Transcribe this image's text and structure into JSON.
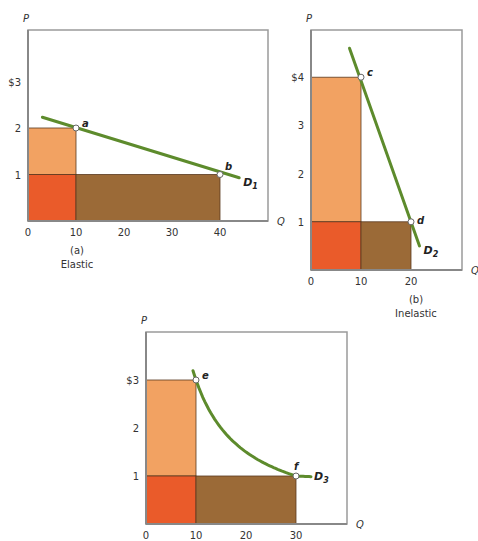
{
  "colors": {
    "upper_rect": "#f2a262",
    "overlap_rect": "#ea5b2a",
    "right_rect": "#9b6a37",
    "demand_line": "#5d8b2c",
    "frame": "#9a9a9a"
  },
  "chart_data": [
    {
      "id": "a",
      "type": "line",
      "panel_label": "(a)",
      "caption": "Elastic",
      "xlabel": "Q",
      "ylabel": "P",
      "xlim": [
        0,
        50
      ],
      "ylim": [
        0,
        4.1
      ],
      "x_ticks": [
        {
          "v": 0,
          "label": "0"
        },
        {
          "v": 10,
          "label": "10"
        },
        {
          "v": 20,
          "label": "20"
        },
        {
          "v": 30,
          "label": "30"
        },
        {
          "v": 40,
          "label": "40"
        }
      ],
      "y_ticks": [
        {
          "v": 1,
          "label": "1"
        },
        {
          "v": 2,
          "label": "2"
        },
        {
          "v": 3,
          "label": "$3"
        }
      ],
      "curve": {
        "name": "D",
        "subscript": "1",
        "shape": "linear",
        "points": [
          [
            3,
            2.23
          ],
          [
            44,
            0.93
          ]
        ]
      },
      "points": [
        {
          "label": "a",
          "q": 10,
          "p": 2
        },
        {
          "label": "b",
          "q": 40,
          "p": 1
        }
      ],
      "rectangles": [
        {
          "role": "upper",
          "q0": 0,
          "q1": 10,
          "p0": 1,
          "p1": 2
        },
        {
          "role": "overlap",
          "q0": 0,
          "q1": 10,
          "p0": 0,
          "p1": 1
        },
        {
          "role": "right",
          "q0": 10,
          "q1": 40,
          "p0": 0,
          "p1": 1
        }
      ]
    },
    {
      "id": "b",
      "type": "line",
      "panel_label": "(b)",
      "caption": "Inelastic",
      "xlabel": "Q",
      "ylabel": "P",
      "xlim": [
        0,
        30
      ],
      "ylim": [
        0,
        5
      ],
      "x_ticks": [
        {
          "v": 0,
          "label": "0"
        },
        {
          "v": 10,
          "label": "10"
        },
        {
          "v": 20,
          "label": "20"
        }
      ],
      "y_ticks": [
        {
          "v": 1,
          "label": "1"
        },
        {
          "v": 2,
          "label": "2"
        },
        {
          "v": 3,
          "label": "3"
        },
        {
          "v": 4,
          "label": "$4"
        }
      ],
      "curve": {
        "name": "D",
        "subscript": "2",
        "shape": "linear",
        "points": [
          [
            7.7,
            4.6
          ],
          [
            21.7,
            0.5
          ]
        ]
      },
      "points": [
        {
          "label": "c",
          "q": 10,
          "p": 4
        },
        {
          "label": "d",
          "q": 20,
          "p": 1
        }
      ],
      "rectangles": [
        {
          "role": "upper",
          "q0": 0,
          "q1": 10,
          "p0": 1,
          "p1": 4
        },
        {
          "role": "overlap",
          "q0": 0,
          "q1": 10,
          "p0": 0,
          "p1": 1
        },
        {
          "role": "right",
          "q0": 10,
          "q1": 20,
          "p0": 0,
          "p1": 1
        }
      ]
    },
    {
      "id": "c",
      "type": "line",
      "panel_label": "",
      "caption": "",
      "xlabel": "Q",
      "ylabel": "P",
      "xlim": [
        0,
        40
      ],
      "ylim": [
        0,
        4
      ],
      "x_ticks": [
        {
          "v": 0,
          "label": "0"
        },
        {
          "v": 10,
          "label": "10"
        },
        {
          "v": 20,
          "label": "20"
        },
        {
          "v": 30,
          "label": "30"
        }
      ],
      "y_ticks": [
        {
          "v": 1,
          "label": "1"
        },
        {
          "v": 2,
          "label": "2"
        },
        {
          "v": 3,
          "label": "$3"
        }
      ],
      "curve": {
        "name": "D",
        "subscript": "3",
        "shape": "unit-elastic",
        "q_range": [
          9.4,
          33
        ],
        "pq": 30
      },
      "points": [
        {
          "label": "e",
          "q": 10,
          "p": 3
        },
        {
          "label": "f",
          "q": 30,
          "p": 1
        }
      ],
      "rectangles": [
        {
          "role": "upper",
          "q0": 0,
          "q1": 10,
          "p0": 1,
          "p1": 3
        },
        {
          "role": "overlap",
          "q0": 0,
          "q1": 10,
          "p0": 0,
          "p1": 1
        },
        {
          "role": "right",
          "q0": 10,
          "q1": 30,
          "p0": 0,
          "p1": 1
        }
      ]
    }
  ]
}
